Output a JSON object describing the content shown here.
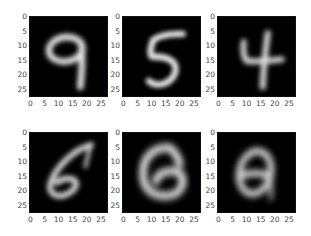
{
  "chart_data": {
    "type": "heatmap",
    "title": "",
    "layout": {
      "rows": 2,
      "cols": 3,
      "grid": false,
      "legend": "none",
      "colormap": "gray"
    },
    "image_size": [
      28,
      28
    ],
    "xlabel": "",
    "ylabel": "",
    "xlim": [
      -0.5,
      27.5
    ],
    "ylim": [
      27.5,
      -0.5
    ],
    "xticks": [
      "0",
      "5",
      "10",
      "15",
      "20",
      "25"
    ],
    "yticks": [
      "0",
      "5",
      "10",
      "15",
      "20",
      "25"
    ],
    "panels": [
      {
        "row": 0,
        "col": 0,
        "digit_depicted": "9"
      },
      {
        "row": 0,
        "col": 1,
        "digit_depicted": "5"
      },
      {
        "row": 0,
        "col": 2,
        "digit_depicted": "4"
      },
      {
        "row": 1,
        "col": 0,
        "digit_depicted": "6"
      },
      {
        "row": 1,
        "col": 1,
        "digit_depicted": "6 (blurry, 8-like)"
      },
      {
        "row": 1,
        "col": 2,
        "digit_depicted": "8 (blurry)"
      }
    ]
  },
  "axes": {
    "xticks": [
      "0",
      "5",
      "10",
      "15",
      "20",
      "25"
    ],
    "yticks": [
      "0",
      "5",
      "10",
      "15",
      "20",
      "25"
    ]
  },
  "colors": {
    "background": "#ffffff",
    "image_bg": "#000000",
    "stroke": "#e6e6e6",
    "tick_text": "#444444"
  }
}
